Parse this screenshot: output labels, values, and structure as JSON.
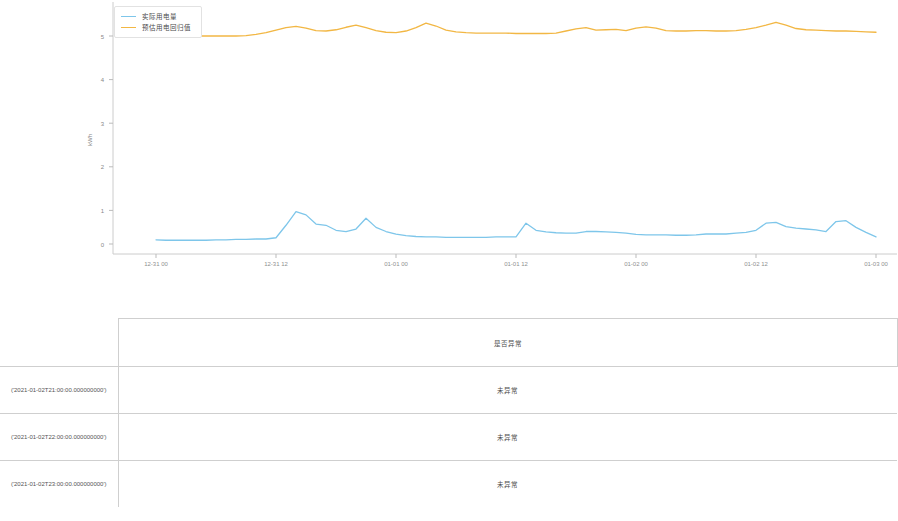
{
  "chart_data": {
    "type": "line",
    "title": "",
    "xlabel": "",
    "ylabel": "kWh",
    "ylim": [
      0,
      5.6
    ],
    "yticks": [
      0,
      1,
      2,
      3,
      4,
      5
    ],
    "ytick_labels": [
      "0",
      "1",
      "2",
      "3",
      "4",
      "5"
    ],
    "grid": false,
    "legend_position": "top-left",
    "xtick_labels": [
      "12-31 00",
      "12-31 12",
      "01-01 00",
      "01-01 12",
      "01-02 00",
      "01-02 12",
      "01-03 00"
    ],
    "x": [
      "12-31 00",
      "12-31 01",
      "12-31 02",
      "12-31 03",
      "12-31 04",
      "12-31 05",
      "12-31 06",
      "12-31 07",
      "12-31 08",
      "12-31 09",
      "12-31 10",
      "12-31 11",
      "12-31 12",
      "12-31 13",
      "12-31 14",
      "12-31 15",
      "12-31 16",
      "12-31 17",
      "12-31 18",
      "12-31 19",
      "12-31 20",
      "12-31 21",
      "12-31 22",
      "12-31 23",
      "01-01 00",
      "01-01 01",
      "01-01 02",
      "01-01 03",
      "01-01 04",
      "01-01 05",
      "01-01 06",
      "01-01 07",
      "01-01 08",
      "01-01 09",
      "01-01 10",
      "01-01 11",
      "01-01 12",
      "01-01 13",
      "01-01 14",
      "01-01 15",
      "01-01 16",
      "01-01 17",
      "01-01 18",
      "01-01 19",
      "01-01 20",
      "01-01 21",
      "01-01 22",
      "01-01 23",
      "01-02 00",
      "01-02 01",
      "01-02 02",
      "01-02 03",
      "01-02 04",
      "01-02 05",
      "01-02 06",
      "01-02 07",
      "01-02 08",
      "01-02 09",
      "01-02 10",
      "01-02 11",
      "01-02 12",
      "01-02 13",
      "01-02 14",
      "01-02 15",
      "01-02 16",
      "01-02 17",
      "01-02 18",
      "01-02 19",
      "01-02 20",
      "01-02 21",
      "01-02 22",
      "01-02 23",
      "01-03 00"
    ],
    "series": [
      {
        "name": "实际用电量",
        "color": "#7ec6ea",
        "values": [
          0.1,
          0.09,
          0.09,
          0.09,
          0.09,
          0.09,
          0.1,
          0.1,
          0.11,
          0.11,
          0.12,
          0.12,
          0.15,
          0.45,
          0.78,
          0.7,
          0.48,
          0.45,
          0.33,
          0.3,
          0.36,
          0.62,
          0.4,
          0.3,
          0.24,
          0.2,
          0.18,
          0.17,
          0.17,
          0.16,
          0.16,
          0.16,
          0.16,
          0.16,
          0.17,
          0.17,
          0.17,
          0.5,
          0.33,
          0.29,
          0.27,
          0.26,
          0.26,
          0.3,
          0.3,
          0.29,
          0.28,
          0.26,
          0.23,
          0.22,
          0.22,
          0.22,
          0.21,
          0.21,
          0.22,
          0.24,
          0.24,
          0.24,
          0.26,
          0.28,
          0.33,
          0.5,
          0.52,
          0.42,
          0.38,
          0.36,
          0.34,
          0.3,
          0.54,
          0.56,
          0.4,
          0.28,
          0.17
        ]
      },
      {
        "name": "预估用电回归值",
        "color": "#f2b744",
        "values": [
          5.05,
          5.02,
          5.0,
          5.0,
          5.0,
          5.0,
          5.0,
          5.0,
          5.0,
          5.01,
          5.04,
          5.08,
          5.14,
          5.2,
          5.23,
          5.19,
          5.13,
          5.12,
          5.15,
          5.21,
          5.26,
          5.2,
          5.13,
          5.09,
          5.08,
          5.12,
          5.2,
          5.31,
          5.24,
          5.14,
          5.1,
          5.08,
          5.07,
          5.07,
          5.07,
          5.07,
          5.06,
          5.06,
          5.06,
          5.06,
          5.07,
          5.12,
          5.17,
          5.2,
          5.14,
          5.15,
          5.16,
          5.13,
          5.19,
          5.22,
          5.19,
          5.13,
          5.12,
          5.12,
          5.13,
          5.13,
          5.12,
          5.12,
          5.13,
          5.16,
          5.2,
          5.26,
          5.33,
          5.26,
          5.18,
          5.15,
          5.14,
          5.13,
          5.12,
          5.12,
          5.11,
          5.1,
          5.09
        ]
      }
    ]
  },
  "legend": {
    "items": [
      {
        "label": "实际用电量",
        "color": "#7ec6ea"
      },
      {
        "label": "预估用电回归值",
        "color": "#f2b744"
      }
    ]
  },
  "table": {
    "header": {
      "index_label": "",
      "value_label": "是否异常"
    },
    "rows": [
      {
        "index": "('2021-01-02T21:00:00.000000000')",
        "value": "未异常"
      },
      {
        "index": "('2021-01-02T22:00:00.000000000')",
        "value": "未异常"
      },
      {
        "index": "('2021-01-02T23:00:00.000000000')",
        "value": "未异常"
      }
    ]
  }
}
